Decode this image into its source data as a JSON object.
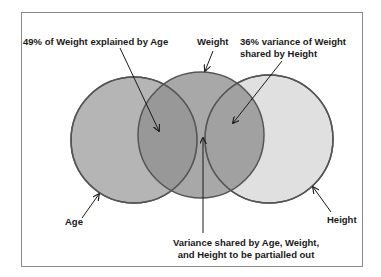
{
  "circles": [
    {
      "id": "age",
      "label": "Age",
      "fill": "#b5b5b5"
    },
    {
      "id": "weight",
      "label": "Weight",
      "fill": "#8f8f8f"
    },
    {
      "id": "height",
      "label": "Height",
      "fill": "#e0e0e0"
    }
  ],
  "annotations": {
    "age_weight": "49% of Weight explained by Age",
    "weight": "Weight",
    "weight_height_line1": "36% variance of Weight",
    "weight_height_line2": "shared by Height",
    "age": "Age",
    "height": "Height",
    "shared_line1": "Variance shared by Age, Weight,",
    "shared_line2": "and Height to be partialled out"
  },
  "colors": {
    "outline": "#555555",
    "arrow": "#1a1a1a",
    "frame": "#8a8a8a",
    "background": "#ffffff"
  }
}
